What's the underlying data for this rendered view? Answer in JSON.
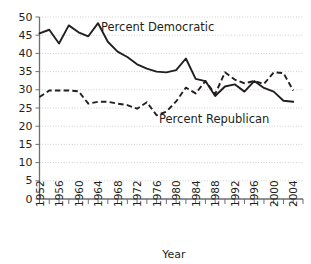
{
  "chart_data": {
    "type": "line",
    "title": "",
    "xlabel": "Year",
    "ylabel": "",
    "xlim": [
      1952,
      2006
    ],
    "ylim": [
      0,
      50
    ],
    "grid": true,
    "legend_position": "inline-annotation",
    "y_ticks": [
      0,
      5,
      10,
      15,
      20,
      25,
      30,
      35,
      40,
      45,
      50
    ],
    "y_tick_labels": [
      "0",
      "5",
      "10",
      "15",
      "20",
      "25",
      "30",
      "35",
      "40",
      "45",
      "50"
    ],
    "x_ticks": [
      1952,
      1956,
      1960,
      1964,
      1968,
      1972,
      1976,
      1980,
      1984,
      1988,
      1992,
      1996,
      2000,
      2004
    ],
    "x_tick_labels": [
      "1952",
      "1956",
      "1960",
      "1964",
      "1968",
      "1972",
      "1976",
      "1980",
      "1984",
      "1988",
      "1992",
      "1996",
      "2000",
      "2004"
    ],
    "x_minor_tick_step": 2,
    "x": [
      1952,
      1954,
      1956,
      1958,
      1960,
      1962,
      1964,
      1966,
      1968,
      1970,
      1972,
      1974,
      1976,
      1978,
      1980,
      1982,
      1984,
      1986,
      1988,
      1990,
      1992,
      1994,
      1996,
      1998,
      2000,
      2002,
      2004
    ],
    "series": [
      {
        "name": "Percent Democratic",
        "style": "solid",
        "color": "#231f20",
        "annotation": "Percent Democratic",
        "values": [
          45.5,
          46.5,
          42.7,
          47.7,
          45.8,
          44.7,
          48.3,
          43.2,
          40.5,
          39.0,
          37.0,
          35.8,
          35.0,
          34.8,
          35.4,
          38.6,
          33.0,
          32.4,
          28.3,
          30.9,
          31.5,
          29.5,
          32.4,
          30.5,
          29.5,
          27.0,
          26.7
        ]
      },
      {
        "name": "Percent Republican",
        "style": "dashed",
        "color": "#231f20",
        "annotation": "Percent Republican",
        "values": [
          28.0,
          29.8,
          29.8,
          29.8,
          29.6,
          26.2,
          26.7,
          26.7,
          26.2,
          25.8,
          24.8,
          26.6,
          23.0,
          24.0,
          26.8,
          30.6,
          29.0,
          32.4,
          28.8,
          34.8,
          32.8,
          31.8,
          32.4,
          31.6,
          34.8,
          34.6,
          29.8
        ]
      }
    ],
    "annotations": [
      {
        "text": "Percent Democratic",
        "x_pixel": 101,
        "y_pixel": 31
      },
      {
        "text": "Percent Republican",
        "x_pixel": 159,
        "y_pixel": 123
      }
    ]
  }
}
